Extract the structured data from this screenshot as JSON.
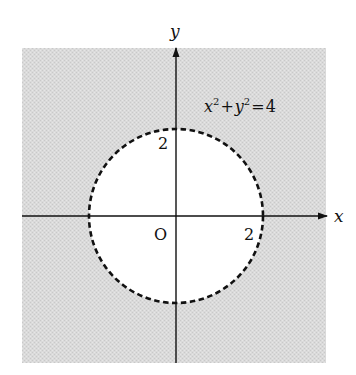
{
  "diagram": {
    "type": "coordinate-plane-region",
    "axes": {
      "x_label": "x",
      "y_label": "y",
      "origin_label": "O"
    },
    "ticks": {
      "x_tick": "2",
      "y_tick": "2"
    },
    "curve": {
      "equation_parts": {
        "x": "x",
        "x_exp": "2",
        "plus": "+",
        "y": "y",
        "y_exp": "2",
        "equals": "=",
        "rhs": "4"
      },
      "equation": "x²+y²=4",
      "radius": 2,
      "center": [
        0,
        0
      ],
      "boundary_style": "dashed"
    },
    "region": {
      "shaded": "outside circle",
      "fill_color": "#d9d9d9"
    },
    "colors": {
      "shade": "#d9d9d9",
      "interior": "#ffffff",
      "stroke": "#111111"
    }
  }
}
